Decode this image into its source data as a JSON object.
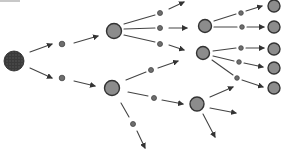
{
  "diagram": {
    "type": "cell-division-tree",
    "colors": {
      "background": "#ffffff",
      "stroke": "#333333",
      "line": "#444444",
      "root_fill": "#3a3a3a",
      "cell_fill": "#8c8c8c",
      "dot_fill": "#6e6e6e"
    },
    "nodes": [
      {
        "id": "root",
        "kind": "root",
        "x": 14,
        "y": 61,
        "r": 10
      },
      {
        "id": "d1",
        "kind": "dot",
        "x": 62,
        "y": 44,
        "r": 2.8
      },
      {
        "id": "d2",
        "kind": "dot",
        "x": 62,
        "y": 78,
        "r": 2.8
      },
      {
        "id": "c1",
        "kind": "cell",
        "x": 114,
        "y": 31,
        "r": 7.5
      },
      {
        "id": "c2",
        "kind": "cell",
        "x": 112,
        "y": 88,
        "r": 7.5
      },
      {
        "id": "d3",
        "kind": "dot",
        "x": 160,
        "y": 13,
        "r": 2.5
      },
      {
        "id": "d4",
        "kind": "dot",
        "x": 160,
        "y": 28,
        "r": 2.5
      },
      {
        "id": "d5",
        "kind": "dot",
        "x": 160,
        "y": 44,
        "r": 2.5
      },
      {
        "id": "d6",
        "kind": "dot",
        "x": 151,
        "y": 70,
        "r": 2.5
      },
      {
        "id": "d7",
        "kind": "dot",
        "x": 154,
        "y": 98,
        "r": 2.5
      },
      {
        "id": "d8",
        "kind": "dot",
        "x": 133,
        "y": 124,
        "r": 2.5
      },
      {
        "id": "c3",
        "kind": "cell",
        "x": 205,
        "y": 26,
        "r": 6.5
      },
      {
        "id": "c4",
        "kind": "cell",
        "x": 203,
        "y": 53,
        "r": 6.5
      },
      {
        "id": "c5",
        "kind": "cell",
        "x": 197,
        "y": 104,
        "r": 7
      },
      {
        "id": "d9",
        "kind": "dot",
        "x": 241,
        "y": 13,
        "r": 2.3
      },
      {
        "id": "d10",
        "kind": "dot",
        "x": 242,
        "y": 27,
        "r": 2.3
      },
      {
        "id": "d11",
        "kind": "dot",
        "x": 241,
        "y": 48,
        "r": 2.3
      },
      {
        "id": "d12",
        "kind": "dot",
        "x": 239,
        "y": 62,
        "r": 2.3
      },
      {
        "id": "d13",
        "kind": "dot",
        "x": 237,
        "y": 78,
        "r": 2.3
      },
      {
        "id": "c6",
        "kind": "cell",
        "x": 274,
        "y": 6,
        "r": 6
      },
      {
        "id": "c7",
        "kind": "cell",
        "x": 274,
        "y": 27,
        "r": 6
      },
      {
        "id": "c8",
        "kind": "cell",
        "x": 274,
        "y": 49,
        "r": 6
      },
      {
        "id": "c9",
        "kind": "cell",
        "x": 274,
        "y": 68,
        "r": 6
      },
      {
        "id": "c10",
        "kind": "cell",
        "x": 274,
        "y": 88,
        "r": 6
      }
    ],
    "edges": [
      {
        "x1": 30,
        "y1": 52,
        "x2": 52,
        "y2": 44,
        "arrow": true
      },
      {
        "x1": 30,
        "y1": 68,
        "x2": 52,
        "y2": 78,
        "arrow": true
      },
      {
        "x1": 74,
        "y1": 43,
        "x2": 98,
        "y2": 36,
        "arrow": true
      },
      {
        "x1": 74,
        "y1": 81,
        "x2": 95,
        "y2": 86,
        "arrow": true
      },
      {
        "x1": 124,
        "y1": 24,
        "x2": 155,
        "y2": 15,
        "arrow": false
      },
      {
        "x1": 124,
        "y1": 29,
        "x2": 155,
        "y2": 28,
        "arrow": false
      },
      {
        "x1": 124,
        "y1": 35,
        "x2": 155,
        "y2": 42,
        "arrow": false
      },
      {
        "x1": 169,
        "y1": 9,
        "x2": 184,
        "y2": 2,
        "arrow": true
      },
      {
        "x1": 169,
        "y1": 28,
        "x2": 187,
        "y2": 28,
        "arrow": true
      },
      {
        "x1": 169,
        "y1": 45,
        "x2": 184,
        "y2": 50,
        "arrow": true
      },
      {
        "x1": 126,
        "y1": 80,
        "x2": 146,
        "y2": 72,
        "arrow": false
      },
      {
        "x1": 158,
        "y1": 68,
        "x2": 178,
        "y2": 61,
        "arrow": true
      },
      {
        "x1": 128,
        "y1": 92,
        "x2": 148,
        "y2": 96,
        "arrow": false
      },
      {
        "x1": 162,
        "y1": 100,
        "x2": 183,
        "y2": 104,
        "arrow": true
      },
      {
        "x1": 121,
        "y1": 103,
        "x2": 129,
        "y2": 117,
        "arrow": false
      },
      {
        "x1": 137,
        "y1": 131,
        "x2": 145,
        "y2": 148,
        "arrow": true
      },
      {
        "x1": 214,
        "y1": 21,
        "x2": 236,
        "y2": 14,
        "arrow": false
      },
      {
        "x1": 246,
        "y1": 11,
        "x2": 262,
        "y2": 6,
        "arrow": true
      },
      {
        "x1": 214,
        "y1": 27,
        "x2": 237,
        "y2": 27,
        "arrow": false
      },
      {
        "x1": 247,
        "y1": 27,
        "x2": 264,
        "y2": 27,
        "arrow": true
      },
      {
        "x1": 213,
        "y1": 51,
        "x2": 236,
        "y2": 48,
        "arrow": false
      },
      {
        "x1": 246,
        "y1": 48,
        "x2": 264,
        "y2": 48,
        "arrow": true
      },
      {
        "x1": 213,
        "y1": 56,
        "x2": 234,
        "y2": 61,
        "arrow": false
      },
      {
        "x1": 244,
        "y1": 63,
        "x2": 263,
        "y2": 67,
        "arrow": true
      },
      {
        "x1": 212,
        "y1": 60,
        "x2": 233,
        "y2": 75,
        "arrow": false
      },
      {
        "x1": 242,
        "y1": 80,
        "x2": 263,
        "y2": 87,
        "arrow": true
      },
      {
        "x1": 210,
        "y1": 97,
        "x2": 233,
        "y2": 87,
        "arrow": true
      },
      {
        "x1": 210,
        "y1": 108,
        "x2": 236,
        "y2": 113,
        "arrow": true
      },
      {
        "x1": 203,
        "y1": 114,
        "x2": 215,
        "y2": 137,
        "arrow": true
      }
    ]
  }
}
